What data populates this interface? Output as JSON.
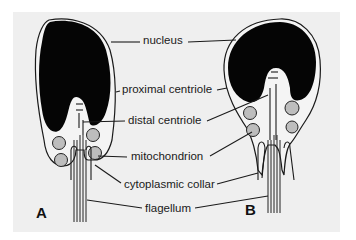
{
  "figure": {
    "panels": [
      {
        "id": "A",
        "label": "A"
      },
      {
        "id": "B",
        "label": "B"
      }
    ],
    "labels": {
      "nucleus": "nucleus",
      "proximal_centriole": "proximal centriole",
      "distal_centriole": "distal centriole",
      "mitochondrion": "mitochondrion",
      "cytoplasmic_collar": "cytoplasmic collar",
      "flagellum": "flagellum"
    },
    "colors": {
      "background": "#ffffff",
      "panel": "#efefef",
      "nucleus": "#050505",
      "mitochondrion": "#bdbdbd",
      "line": "#1a1a1a"
    }
  }
}
